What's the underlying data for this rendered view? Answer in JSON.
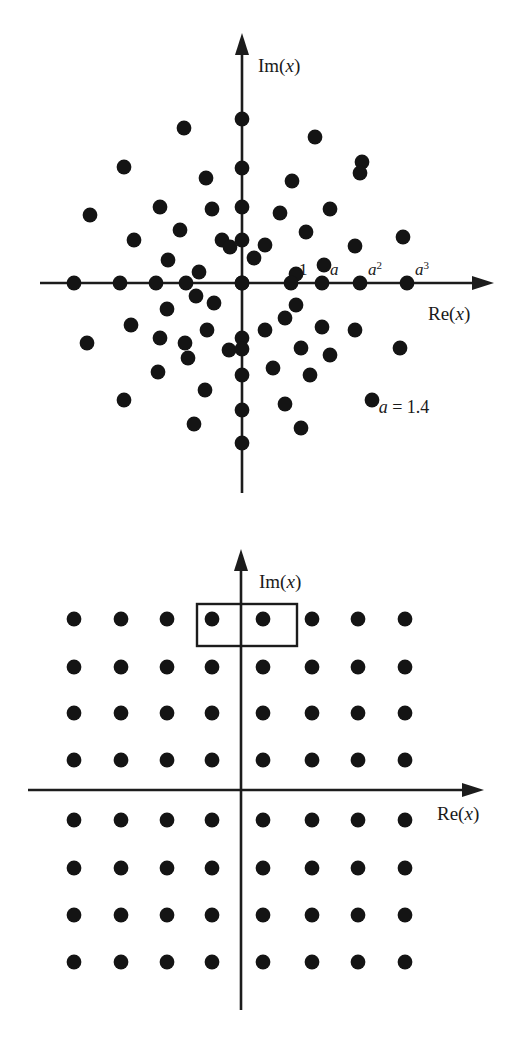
{
  "figure": {
    "ink_color": "#141414",
    "background_color": "#ffffff"
  },
  "panels": [
    {
      "id": "scatter-panel",
      "kind": "complex-plane-scatter",
      "axes": {
        "imaginary_label": "Im(x)",
        "imaginary_label_italic_part": "x",
        "real_label": "Re(x)",
        "real_label_italic_part": "x",
        "origin_px": [
          242,
          283
        ]
      },
      "tick_marks": [
        {
          "label": "1",
          "italic": false,
          "superscript": "",
          "x_px": 291
        },
        {
          "label": "a",
          "italic": true,
          "superscript": "",
          "x_px": 322
        },
        {
          "label": "a",
          "italic": true,
          "superscript": "2",
          "x_px": 360
        },
        {
          "label": "a",
          "italic": true,
          "superscript": "3",
          "x_px": 407
        }
      ],
      "annotation": {
        "text": "a = 1.4",
        "italic_symbol": "a",
        "equals_value": "1.4",
        "x_px": 404,
        "y_px": 413
      }
    },
    {
      "id": "lattice-panel",
      "kind": "complex-plane-lattice",
      "axes": {
        "imaginary_label": "Im(x)",
        "imaginary_label_italic_part": "x",
        "real_label": "Re(x)",
        "real_label_italic_part": "x",
        "origin_px": [
          241,
          790
        ]
      },
      "highlight_rect": {
        "x_px": 197,
        "y_px": 604,
        "width_px": 100,
        "height_px": 42,
        "encloses_points": 2
      }
    }
  ],
  "chart_data": [
    {
      "type": "scatter",
      "title": "Complex plane scatter of x values",
      "xlabel": "Re(x)",
      "ylabel": "Im(x)",
      "grid": false,
      "legend": null,
      "annotations": [
        "a = 1.4",
        "1",
        "a",
        "a^2",
        "a^3"
      ],
      "parameter_a": 1.4,
      "axis_tick_positions_px": {
        "one": 291,
        "a": 322,
        "a2": 360,
        "a3": 407
      },
      "origin_px": [
        242,
        283
      ],
      "point_radius_px": 7.4,
      "points_px": [
        [
          242,
          119
        ],
        [
          184,
          128
        ],
        [
          315,
          137
        ],
        [
          362,
          162
        ],
        [
          124,
          167
        ],
        [
          242,
          168
        ],
        [
          206,
          178
        ],
        [
          292,
          181
        ],
        [
          360,
          173
        ],
        [
          160,
          207
        ],
        [
          212,
          209
        ],
        [
          242,
          207
        ],
        [
          280,
          213
        ],
        [
          330,
          209
        ],
        [
          90,
          215
        ],
        [
          134,
          240
        ],
        [
          180,
          230
        ],
        [
          222,
          240
        ],
        [
          242,
          240
        ],
        [
          265,
          245
        ],
        [
          306,
          232
        ],
        [
          403,
          237
        ],
        [
          355,
          246
        ],
        [
          168,
          260
        ],
        [
          199,
          272
        ],
        [
          230,
          247
        ],
        [
          254,
          258
        ],
        [
          296,
          274
        ],
        [
          324,
          265
        ],
        [
          74,
          283
        ],
        [
          120,
          283
        ],
        [
          156,
          283
        ],
        [
          186,
          283
        ],
        [
          242,
          283
        ],
        [
          291,
          283
        ],
        [
          322,
          283
        ],
        [
          360,
          283
        ],
        [
          407,
          283
        ],
        [
          196,
          296
        ],
        [
          167,
          309
        ],
        [
          296,
          305
        ],
        [
          214,
          303
        ],
        [
          242,
          283
        ],
        [
          285,
          318
        ],
        [
          131,
          325
        ],
        [
          207,
          330
        ],
        [
          160,
          338
        ],
        [
          242,
          338
        ],
        [
          265,
          330
        ],
        [
          322,
          327
        ],
        [
          355,
          330
        ],
        [
          87,
          343
        ],
        [
          185,
          343
        ],
        [
          229,
          350
        ],
        [
          301,
          348
        ],
        [
          400,
          348
        ],
        [
          242,
          349
        ],
        [
          188,
          358
        ],
        [
          273,
          368
        ],
        [
          330,
          355
        ],
        [
          158,
          372
        ],
        [
          310,
          375
        ],
        [
          242,
          375
        ],
        [
          205,
          390
        ],
        [
          124,
          400
        ],
        [
          285,
          404
        ],
        [
          372,
          400
        ],
        [
          194,
          424
        ],
        [
          242,
          410
        ],
        [
          301,
          428
        ],
        [
          242,
          443
        ]
      ],
      "n_points": 71
    },
    {
      "type": "scatter",
      "title": "Square lattice of x values in the complex plane",
      "xlabel": "Re(x)",
      "ylabel": "Im(x)",
      "grid": false,
      "legend": null,
      "lattice": {
        "columns_px": [
          74,
          121,
          167,
          212,
          263,
          312,
          358,
          405
        ],
        "rows_px": [
          619,
          667,
          713,
          760,
          820,
          868,
          915,
          962
        ],
        "n_columns": 8,
        "n_rows": 8,
        "n_points": 64
      },
      "origin_px": [
        241,
        790
      ],
      "point_radius_px": 7.4,
      "highlighted_points_px": [
        [
          212,
          619
        ],
        [
          263,
          619
        ]
      ]
    }
  ]
}
